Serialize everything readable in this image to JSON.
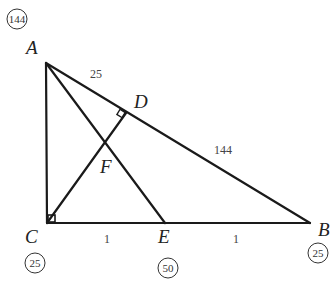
{
  "diagram": {
    "type": "geometry-triangle",
    "vertices": {
      "A": {
        "label": "A",
        "x": 46,
        "y": 63
      },
      "B": {
        "label": "B",
        "x": 310,
        "y": 223
      },
      "C": {
        "label": "C",
        "x": 47,
        "y": 223
      },
      "D": {
        "label": "D",
        "x": 126,
        "y": 113
      },
      "E": {
        "label": "E",
        "x": 165,
        "y": 223
      },
      "F": {
        "label": "F",
        "x": 0,
        "y": 0
      }
    },
    "segment_labels": {
      "AD": "25",
      "DB": "144",
      "CE": "1",
      "EB": "1"
    },
    "circled_weights": {
      "A": "144",
      "C": "25",
      "E": "50",
      "B": "25"
    },
    "right_angles": [
      "C",
      "D"
    ]
  }
}
